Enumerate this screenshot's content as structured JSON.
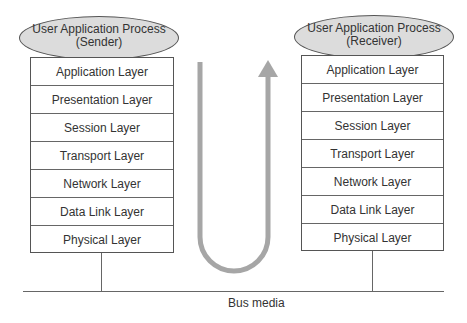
{
  "sender": {
    "process_label_line1": "User Application Process",
    "process_label_line2": "(Sender)",
    "layers": [
      "Application Layer",
      "Presentation Layer",
      "Session Layer",
      "Transport Layer",
      "Network Layer",
      "Data Link Layer",
      "Physical Layer"
    ]
  },
  "receiver": {
    "process_label_line1": "User Application Process",
    "process_label_line2": "(Receiver)",
    "layers": [
      "Application Layer",
      "Presentation Layer",
      "Session Layer",
      "Transport Layer",
      "Network Layer",
      "Data Link Layer",
      "Physical Layer"
    ]
  },
  "bus": {
    "label": "Bus media"
  },
  "colors": {
    "arrow": "#a6a6a6",
    "oval_fill": "#dcdcdc",
    "line": "#555555"
  }
}
